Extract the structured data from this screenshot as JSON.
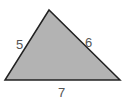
{
  "diagram": {
    "type": "triangle",
    "fill": "#b3b3b3",
    "stroke": "#222222",
    "vertices": [
      [
        49,
        10
      ],
      [
        5,
        80
      ],
      [
        120,
        80
      ]
    ],
    "sides": {
      "left": "5",
      "right": "6",
      "bottom": "7"
    }
  }
}
